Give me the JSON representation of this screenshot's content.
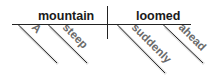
{
  "diagram": {
    "type": "sentence-diagram",
    "subject": "mountain",
    "verb": "loomed",
    "subject_modifiers": [
      "A",
      "steep"
    ],
    "verb_modifiers": [
      "suddenly",
      "ahead"
    ]
  },
  "colors": {
    "line": "#222222",
    "main_text": "#1a1a1a",
    "modifier_text": "#6a6a6a"
  }
}
